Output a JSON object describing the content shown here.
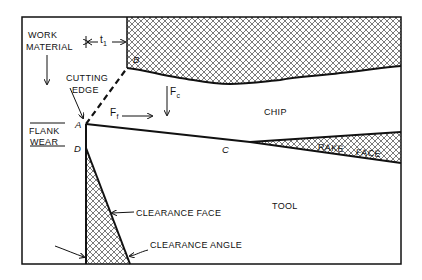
{
  "diagram": {
    "type": "orthogonal-cutting-tool-wear",
    "labels": {
      "work_material_1": "WORK",
      "work_material_2": "MATERIAL",
      "t1": "t",
      "t1_sub": "1",
      "cutting_edge_1": "CUTTING",
      "cutting_edge_2": "EDGE",
      "flank_wear_1": "FLANK",
      "flank_wear_2": "WEAR",
      "point_a": "A",
      "point_b": "B",
      "point_c": "C",
      "point_d": "D",
      "ff": "F",
      "ff_sub": "f",
      "fc": "F",
      "fc_sub": "c",
      "chip": "CHIP",
      "rake_face_1": "RAKE",
      "rake_face_2": "FACE",
      "tool": "TOOL",
      "clearance_face": "CLEARANCE FACE",
      "clearance_angle": "CLEARANCE ANGLE"
    },
    "regions": [
      "work material",
      "chip",
      "tool",
      "flank wear land",
      "crater (rake face) wear"
    ],
    "colors": {
      "line": "#111111",
      "background": "#ffffff"
    }
  }
}
